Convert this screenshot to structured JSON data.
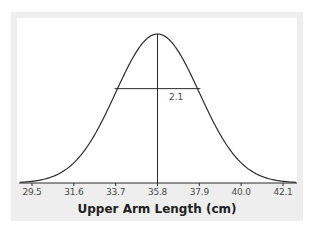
{
  "chart_data": {
    "type": "line",
    "title": "",
    "xlabel": "Upper Arm Length (cm)",
    "ylabel": "",
    "distribution": "normal",
    "mean": 35.8,
    "sd": 2.1,
    "x_ticks": [
      29.5,
      31.6,
      33.7,
      35.8,
      37.9,
      40.0,
      42.1
    ],
    "x_tick_labels": [
      "29.5",
      "31.6",
      "33.7",
      "35.8",
      "37.9",
      "40.0",
      "42.1"
    ],
    "xlim": [
      29.2,
      42.6
    ],
    "annotations": [
      {
        "type": "vertical-line",
        "x": 35.8,
        "label": "mean"
      },
      {
        "type": "horizontal-segment",
        "from": 33.7,
        "to": 37.9,
        "label": "2.1"
      }
    ],
    "grid": false,
    "legend": null
  },
  "labels": {
    "sd_label": "2.1",
    "xlabel": "Upper Arm Length (cm)",
    "ticks": [
      "29.5",
      "31.6",
      "33.7",
      "35.8",
      "37.9",
      "40.0",
      "42.1"
    ]
  },
  "colors": {
    "curve": "#2b2b2b",
    "frame": "#eeeeee",
    "plot_bg": "#ffffff",
    "text": "#4a4a4a"
  }
}
